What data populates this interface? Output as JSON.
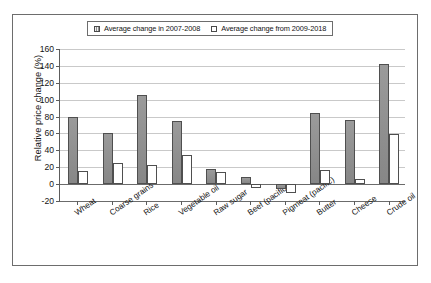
{
  "chart_data": {
    "type": "bar",
    "title": "",
    "xlabel": "",
    "ylabel": "Relative price change (%)",
    "ylim": [
      -20,
      160
    ],
    "ytick_step": 20,
    "yticks": [
      160,
      140,
      120,
      100,
      80,
      60,
      40,
      20,
      0,
      -20
    ],
    "ytick_labels": [
      "160",
      "140",
      "120",
      "100",
      "80",
      "60",
      "40",
      "20",
      "0",
      "-20"
    ],
    "grid": true,
    "legend_position": "top",
    "categories": [
      "Wheat",
      "Coarse grains",
      "Rice",
      "Vegetable oil",
      "Raw sugar",
      "Beef (pacific)",
      "Pigmeat (pacific)",
      "Butter",
      "Cheese",
      "Crude oil"
    ],
    "series": [
      {
        "name": "Average change in 2007-2008",
        "swatch": "hatch",
        "color": "#8f8f8f",
        "values": [
          79,
          61,
          105,
          75,
          18,
          9,
          -6,
          84,
          76,
          142
        ]
      },
      {
        "name": "Average change from 2009-2018",
        "swatch": "open",
        "color": "#ffffff",
        "values": [
          16,
          25,
          23,
          35,
          14,
          -5,
          -11,
          17,
          6,
          59
        ]
      }
    ]
  },
  "legend": {
    "items": [
      {
        "label": "Average change in 2007-2008"
      },
      {
        "label": "Average change from 2009-2018"
      }
    ]
  }
}
